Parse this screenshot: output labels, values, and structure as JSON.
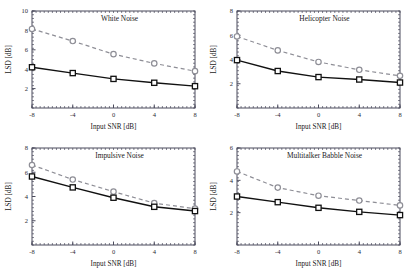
{
  "figure": {
    "xlabel": "Input SNR [dB]",
    "ylabel": "LSD [dB]",
    "x_ticks": [
      "-8",
      "-4",
      "0",
      "4",
      "8"
    ],
    "x_values": [
      -8,
      -4,
      0,
      4,
      8
    ],
    "xlim": [
      -8,
      8
    ],
    "colors": {
      "series_solid": "#111111",
      "series_dashed": "#8e8e96",
      "axis": "#4a4a5c",
      "background": "#ffffff"
    },
    "panels": [
      {
        "title": "White Noise",
        "ylim": [
          0,
          10
        ],
        "y_ticks": [
          "2",
          "4",
          "6",
          "8",
          "10"
        ],
        "y_tick_values": [
          2,
          4,
          6,
          8,
          10
        ]
      },
      {
        "title": "Helicopter Noise",
        "ylim": [
          0,
          8
        ],
        "y_ticks": [
          "2",
          "4",
          "6",
          "8"
        ],
        "y_tick_values": [
          2,
          4,
          6,
          8
        ]
      },
      {
        "title": "Impulsive Noise",
        "ylim": [
          0,
          8
        ],
        "y_ticks": [
          "2",
          "4",
          "6",
          "8"
        ],
        "y_tick_values": [
          2,
          4,
          6,
          8
        ]
      },
      {
        "title": "Multitalker Babble Noise",
        "ylim": [
          0,
          6
        ],
        "y_ticks": [
          "2",
          "4",
          "6"
        ],
        "y_tick_values": [
          2,
          4,
          6
        ]
      }
    ]
  },
  "chart_data": [
    {
      "type": "line",
      "title": "White Noise",
      "xlabel": "Input SNR [dB]",
      "ylabel": "LSD [dB]",
      "x": [
        -8,
        -4,
        0,
        4,
        8
      ],
      "xlim": [
        -8,
        8
      ],
      "ylim": [
        0,
        10
      ],
      "yticks": [
        2,
        4,
        6,
        8,
        10
      ],
      "xticks": [
        -8,
        -4,
        0,
        4,
        8
      ],
      "grid": false,
      "legend": "none",
      "series": [
        {
          "name": "dashed-circle",
          "style": "dashed",
          "marker": "circle",
          "values": [
            8.15,
            6.9,
            5.55,
            4.6,
            3.8
          ]
        },
        {
          "name": "solid-square",
          "style": "solid",
          "marker": "square",
          "values": [
            4.2,
            3.6,
            3.0,
            2.6,
            2.25
          ]
        }
      ]
    },
    {
      "type": "line",
      "title": "Helicopter Noise",
      "xlabel": "Input SNR [dB]",
      "ylabel": "LSD [dB]",
      "x": [
        -8,
        -4,
        0,
        4,
        8
      ],
      "xlim": [
        -8,
        8
      ],
      "ylim": [
        0,
        8
      ],
      "yticks": [
        2,
        4,
        6,
        8
      ],
      "xticks": [
        -8,
        -4,
        0,
        4,
        8
      ],
      "grid": false,
      "legend": "none",
      "series": [
        {
          "name": "dashed-circle",
          "style": "dashed",
          "marker": "circle",
          "values": [
            5.9,
            4.75,
            3.8,
            3.15,
            2.65
          ]
        },
        {
          "name": "solid-square",
          "style": "solid",
          "marker": "square",
          "values": [
            3.95,
            3.05,
            2.55,
            2.35,
            2.1
          ]
        }
      ]
    },
    {
      "type": "line",
      "title": "Impulsive Noise",
      "xlabel": "Input SNR [dB]",
      "ylabel": "LSD [dB]",
      "x": [
        -8,
        -4,
        0,
        4,
        8
      ],
      "xlim": [
        -8,
        8
      ],
      "ylim": [
        0,
        8
      ],
      "yticks": [
        2,
        4,
        6,
        8
      ],
      "xticks": [
        -8,
        -4,
        0,
        4,
        8
      ],
      "grid": false,
      "legend": "none",
      "series": [
        {
          "name": "dashed-circle",
          "style": "dashed",
          "marker": "circle",
          "values": [
            6.6,
            5.4,
            4.4,
            3.45,
            3.0
          ]
        },
        {
          "name": "solid-square",
          "style": "solid",
          "marker": "square",
          "values": [
            5.65,
            4.75,
            3.9,
            3.15,
            2.8
          ]
        }
      ]
    },
    {
      "type": "line",
      "title": "Multitalker Babble Noise",
      "xlabel": "Input SNR [dB]",
      "ylabel": "LSD [dB]",
      "x": [
        -8,
        -4,
        0,
        4,
        8
      ],
      "xlim": [
        -8,
        8
      ],
      "ylim": [
        0,
        6
      ],
      "yticks": [
        2,
        4,
        6
      ],
      "xticks": [
        -8,
        -4,
        0,
        4,
        8
      ],
      "grid": false,
      "legend": "none",
      "series": [
        {
          "name": "dashed-circle",
          "style": "dashed",
          "marker": "circle",
          "values": [
            4.55,
            3.55,
            3.05,
            2.75,
            2.45
          ]
        },
        {
          "name": "solid-square",
          "style": "solid",
          "marker": "square",
          "values": [
            3.0,
            2.65,
            2.3,
            2.05,
            1.85
          ]
        }
      ]
    }
  ]
}
